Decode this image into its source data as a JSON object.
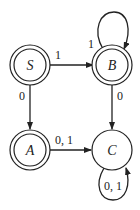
{
  "diagram": {
    "type": "finite-automaton",
    "states": [
      {
        "id": "S",
        "label": "S",
        "accepting": true,
        "cx": 30,
        "cy": 65
      },
      {
        "id": "B",
        "label": "B",
        "accepting": true,
        "cx": 112,
        "cy": 65
      },
      {
        "id": "A",
        "label": "A",
        "accepting": true,
        "cx": 30,
        "cy": 150
      },
      {
        "id": "C",
        "label": "C",
        "accepting": false,
        "cx": 112,
        "cy": 150
      }
    ],
    "transitions": [
      {
        "from": "S",
        "to": "B",
        "label": "1"
      },
      {
        "from": "S",
        "to": "A",
        "label": "0"
      },
      {
        "from": "B",
        "to": "B",
        "label": "1"
      },
      {
        "from": "B",
        "to": "C",
        "label": "0"
      },
      {
        "from": "A",
        "to": "C",
        "label": "0, 1"
      },
      {
        "from": "C",
        "to": "C",
        "label": "0, 1"
      }
    ]
  }
}
